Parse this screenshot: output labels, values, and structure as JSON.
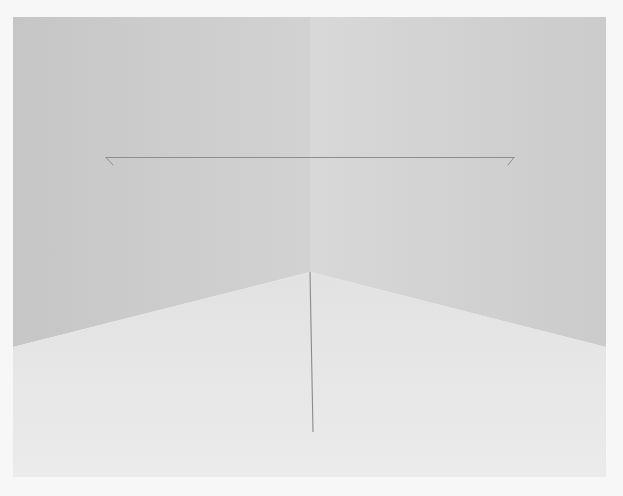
{
  "image": {
    "subject": "Minimalist installation in an empty white room corner",
    "description": "Two walls meeting at a corner with a thin horizontal line drawn across both walls and a thin line running down the floor from the corner.",
    "colors": {
      "border": "#f7f7f7",
      "left_wall": "#c9c9c9",
      "right_wall": "#d3d3d3",
      "floor": "#e6e6e6",
      "line": "#8a8a8a"
    }
  }
}
